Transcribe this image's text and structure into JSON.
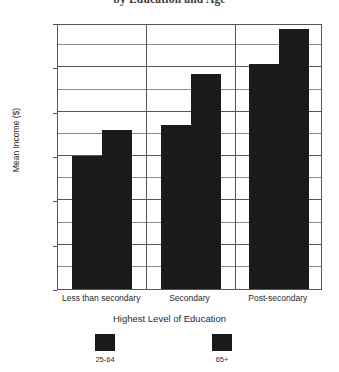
{
  "chart_data": {
    "type": "bar",
    "title": "by Education and Age",
    "xlabel": "Highest Level of Education",
    "ylabel": "Mean Income ($)",
    "categories": [
      "Less than secondary",
      "Secondary",
      "Post-secondary"
    ],
    "series": [
      {
        "name": "25-64",
        "values": [
          15000,
          18500,
          25400
        ],
        "color": "#1a1a1a"
      },
      {
        "name": "65+",
        "values": [
          17900,
          24300,
          29300
        ],
        "color": "#1a1a1a"
      }
    ],
    "ylim": [
      0,
      30000
    ],
    "y_ticks": [
      0,
      5000,
      10000,
      15000,
      20000,
      25000,
      30000
    ],
    "y_tick_labels": [
      "0",
      "5000",
      "10000",
      "15000",
      "20000",
      "25000",
      "30000"
    ],
    "y_minor_ticks": [
      2500,
      7500,
      12500,
      17500,
      22500,
      27500
    ],
    "grid": true,
    "legend_position": "bottom"
  },
  "axes": {
    "y_label": "Mean Income ($)",
    "x_label": "Highest Level of Education"
  },
  "legend": {
    "items": [
      {
        "label": "25-64"
      },
      {
        "label": "65+"
      }
    ]
  },
  "colors": {
    "bar": "#1a1a1a",
    "axis": "#55565a",
    "minor_grid": "#8a8b8f",
    "background": "#ffffff",
    "text": "#2a2a2a"
  }
}
